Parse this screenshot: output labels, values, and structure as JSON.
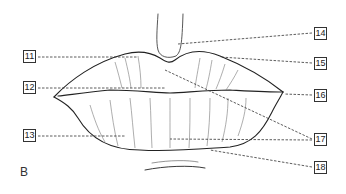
{
  "figure": {
    "panel_letter": "B",
    "labels": [
      {
        "id": "11",
        "x": 23,
        "y": 50
      },
      {
        "id": "12",
        "x": 23,
        "y": 81
      },
      {
        "id": "13",
        "x": 23,
        "y": 129
      },
      {
        "id": "14",
        "x": 314,
        "y": 27
      },
      {
        "id": "15",
        "x": 314,
        "y": 57
      },
      {
        "id": "16",
        "x": 314,
        "y": 89
      },
      {
        "id": "17",
        "x": 314,
        "y": 133
      },
      {
        "id": "18",
        "x": 314,
        "y": 161
      }
    ]
  }
}
